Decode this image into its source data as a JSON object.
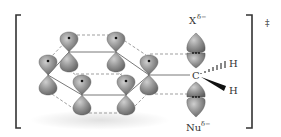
{
  "diagram": {
    "type": "chemistry-transition-state",
    "transition_state_symbol": "‡",
    "leaving_group": {
      "label": "X",
      "charge": "δ−"
    },
    "nucleophile": {
      "label": "Nu",
      "charge": "δ−"
    },
    "central_atom": {
      "label": "C"
    },
    "substituents": [
      {
        "label": "H",
        "bond": "hashed-wedge"
      },
      {
        "label": "H",
        "bond": "solid-wedge"
      }
    ],
    "ring": {
      "atoms": 6,
      "orbitals": "p",
      "orbital_color": "#8a8a8a"
    },
    "colors": {
      "orbital": "#8a8a8a",
      "orbital_highlight": "#c9c9c9",
      "line": "#555555",
      "text": "#333333"
    }
  }
}
